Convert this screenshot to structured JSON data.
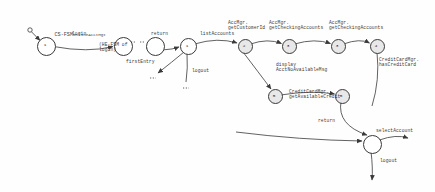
{
  "diagram": {
    "title_main": "CS-FSM",
    "title_sub": "OnlineAcctMgt",
    "type": "state-machine-diagram",
    "ink_color": "#3a3a3a",
    "fill_color": "#f2f2f2",
    "states": [
      {
        "id": "s1",
        "label": "1",
        "cx": 45,
        "cy": 45,
        "r": 8.5,
        "shaded": false
      },
      {
        "id": "s2",
        "label": "",
        "cx": 122,
        "cy": 45,
        "r": 8.5,
        "shaded": false
      },
      {
        "id": "s3",
        "label": "",
        "cx": 181,
        "cy": 45,
        "r": 8.5,
        "shaded": false
      },
      {
        "id": "s4",
        "label": "1",
        "cx": 187,
        "cy": 45,
        "r": 7.5,
        "shaded": false
      },
      {
        "id": "s5",
        "label": "2",
        "cx": 244,
        "cy": 45,
        "r": 6.5,
        "shaded": true
      },
      {
        "id": "s6",
        "label": "3",
        "cx": 288,
        "cy": 45,
        "r": 6.5,
        "shaded": true
      },
      {
        "id": "s7",
        "label": "3",
        "cx": 337,
        "cy": 45,
        "r": 6.5,
        "shaded": true
      },
      {
        "id": "s8",
        "label": "4",
        "cx": 376,
        "cy": 45,
        "r": 6.5,
        "shaded": true
      },
      {
        "id": "s9",
        "label": "5",
        "cx": 274,
        "cy": 95,
        "r": 6.5,
        "shaded": true
      },
      {
        "id": "s10",
        "label": "5",
        "cx": 341,
        "cy": 95,
        "r": 6.5,
        "shaded": true
      },
      {
        "id": "s11",
        "label": "",
        "cx": 371,
        "cy": 143,
        "r": 8.5,
        "shaded": false
      }
    ],
    "transitions": [
      {
        "name": "login",
        "x": 72,
        "y": 33
      },
      {
        "name": "return",
        "x": 151,
        "y": 33
      },
      {
        "name": "listAccounts",
        "x": 205,
        "y": 33
      },
      {
        "name": "firstEntry",
        "x": 131,
        "y": 60
      },
      {
        "name": "logout",
        "x": 194,
        "y": 62
      },
      {
        "name": "return",
        "x": 318,
        "y": 121
      },
      {
        "name": "selectAccount",
        "x": 381,
        "y": 131
      },
      {
        "name": "logout",
        "x": 382,
        "y": 160
      }
    ],
    "annotations": [
      {
        "text": "(HE-FSM of\nlogin)",
        "x": 99,
        "y": 44
      },
      {
        "text": "AccMgr.\ngetCustomerId",
        "x": 228,
        "y": 22
      },
      {
        "text": "AccMgr.\ngetCheckingAccounts",
        "x": 270,
        "y": 22
      },
      {
        "text": "AccMgr.\ngetCheckingAccounts",
        "x": 330,
        "y": 22
      },
      {
        "text": "CreditCardMgr.\nhasCreditCard",
        "x": 379,
        "y": 58
      },
      {
        "text": "display\nAcctNoAvailableMsg",
        "x": 276,
        "y": 63
      },
      {
        "text": "CreditCardMgr.\ngetAvailableCredit",
        "x": 289,
        "y": 90
      }
    ],
    "initial_marker": {
      "cx": 30,
      "cy": 30,
      "r": 2.2
    }
  }
}
